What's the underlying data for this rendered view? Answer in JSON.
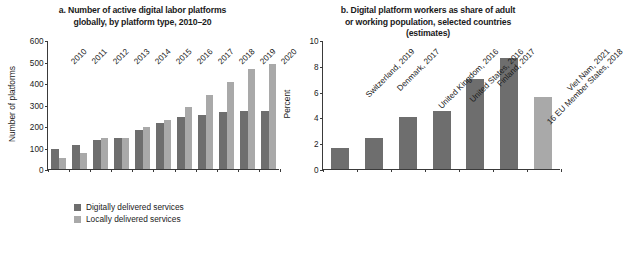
{
  "chart_data": [
    {
      "id": "panel-a",
      "type": "bar",
      "title": "a. Number of active digital labor platforms globally,  by platform type, 2010–20",
      "title_lines": [
        "a. Number of active digital labor platforms",
        "globally,  by platform type, 2010–20"
      ],
      "xlabel": "",
      "ylabel": "Number of platforms",
      "ylim": [
        0,
        600
      ],
      "yticks": [
        0,
        100,
        200,
        300,
        400,
        500,
        600
      ],
      "grid": false,
      "legend_position": "bottom-center",
      "categories": [
        "2010",
        "2011",
        "2012",
        "2013",
        "2014",
        "2015",
        "2016",
        "2017",
        "2018",
        "2019",
        "2020"
      ],
      "series": [
        {
          "name": "Digitally delivered services",
          "color": "#6e6e6e",
          "values": [
            92,
            112,
            133,
            143,
            183,
            212,
            242,
            253,
            263,
            268,
            272
          ]
        },
        {
          "name": "Locally delivered services",
          "color": "#a9a9a9",
          "values": [
            52,
            73,
            145,
            143,
            196,
            228,
            288,
            345,
            405,
            465,
            487
          ]
        }
      ]
    },
    {
      "id": "panel-b",
      "type": "bar",
      "title": "b. Digital platform workers as share of adult or working population, selected countries (estimates)",
      "title_lines": [
        "b. Digital platform workers as share of adult",
        "or working population, selected countries",
        "(estimates)"
      ],
      "xlabel": "",
      "ylabel": "Percent",
      "ylim": [
        0,
        10
      ],
      "yticks": [
        0,
        2,
        4,
        6,
        8,
        10
      ],
      "grid": false,
      "legend_position": "none",
      "categories": [
        "Switzerland, 2019",
        "Denmark, 2017",
        "United Kingdom, 2016",
        "United States, 2016",
        "Finland, 2017",
        "16 EU Member States, 2018",
        "Viet Nam, 2021"
      ],
      "values": [
        1.6,
        2.4,
        4.0,
        4.5,
        7.0,
        8.6,
        5.6
      ],
      "bar_colors": [
        "#6e6e6e",
        "#6e6e6e",
        "#6e6e6e",
        "#6e6e6e",
        "#6e6e6e",
        "#6e6e6e",
        "#a9a9a9"
      ]
    }
  ],
  "colors": {
    "dark_bar": "#6e6e6e",
    "light_bar": "#a9a9a9",
    "axis": "#3a3a3a",
    "text": "#1a1a1a",
    "background": "#ffffff"
  }
}
